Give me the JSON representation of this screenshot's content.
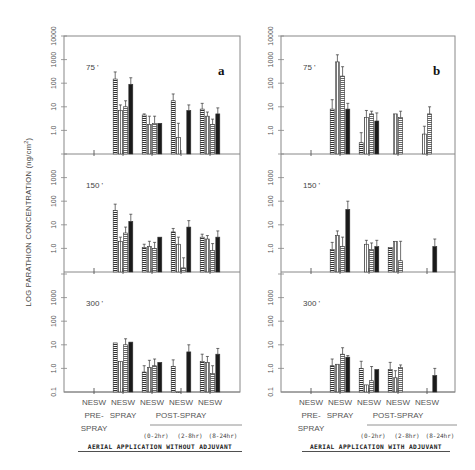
{
  "chart_data": [
    {
      "type": "bar",
      "panel": "a",
      "title": "AERIAL APPLICATION WITHOUT ADJUVANT",
      "ylabel": "LOG PARATHION CONCENTRATION (ng/cm2)",
      "yscale": "log",
      "ylim": [
        0.1,
        10000
      ],
      "yticks": [
        "0.1",
        "1.0",
        "10",
        "100",
        "1000",
        "10000"
      ],
      "series_names": [
        "N",
        "E",
        "S",
        "W"
      ],
      "categories": [
        "PRE-SPRAY",
        "SPRAY",
        "POST-SPRAY (0-2hr)",
        "POST-SPRAY (2-8hr)",
        "POST-SPRAY (8-24hr)"
      ],
      "category_top_labels": [
        "NESW",
        "NESW",
        "NESW",
        "NESW",
        "NESW"
      ],
      "rows": [
        {
          "distance": "75 '",
          "values": [
            [
              null,
              null,
              null,
              null
            ],
            [
              150,
              7,
              10,
              90
            ],
            [
              4.5,
              1.8,
              2,
              2
            ],
            [
              18,
              0.5,
              null,
              7
            ],
            [
              8,
              4,
              1.8,
              5
            ]
          ],
          "errors_upper": [
            [
              null,
              null,
              null,
              null
            ],
            [
              300,
              12,
              18,
              170
            ],
            [
              5,
              4,
              4,
              null
            ],
            [
              35,
              2,
              null,
              12
            ],
            [
              14,
              6,
              3,
              9
            ]
          ]
        },
        {
          "distance": "150 '",
          "values": [
            [
              null,
              null,
              null,
              null
            ],
            [
              40,
              2,
              4.5,
              14
            ],
            [
              1.1,
              1.2,
              1,
              3
            ],
            [
              5,
              1.5,
              0.15,
              8
            ],
            [
              3,
              2.5,
              0.8,
              3
            ]
          ],
          "errors_upper": [
            [
              null,
              null,
              null,
              null
            ],
            [
              75,
              3,
              8,
              28
            ],
            [
              1.5,
              2,
              1.8,
              null
            ],
            [
              7,
              3,
              0.4,
              15
            ],
            [
              4,
              3.5,
              1.6,
              5.5
            ]
          ]
        },
        {
          "distance": "300 '",
          "values": [
            [
              null,
              null,
              null,
              null
            ],
            [
              12,
              2,
              10,
              13
            ],
            [
              0.7,
              1.1,
              1.3,
              1.8
            ],
            [
              1.2,
              0.1,
              null,
              5
            ],
            [
              2,
              1.8,
              0.6,
              4
            ]
          ],
          "errors_upper": [
            [
              null,
              null,
              null,
              null
            ],
            [
              null,
              null,
              18,
              null
            ],
            [
              1.3,
              2.2,
              2.5,
              null
            ],
            [
              2.3,
              null,
              null,
              10
            ],
            [
              4,
              3.2,
              1.3,
              7
            ]
          ]
        }
      ]
    },
    {
      "type": "bar",
      "panel": "b",
      "title": "AERIAL APPLICATION WITH ADJUVANT",
      "ylabel": "LOG PARATHION CONCENTRATION (ng/cm2)",
      "yscale": "log",
      "ylim": [
        0.1,
        10000
      ],
      "yticks": [
        "0.1",
        "1.0",
        "10",
        "100",
        "1000",
        "10000"
      ],
      "series_names": [
        "N",
        "E",
        "S",
        "W"
      ],
      "categories": [
        "PRE-SPRAY",
        "SPRAY",
        "POST-SPRAY (0-2hr)",
        "POST-SPRAY (2-8hr)",
        "POST-SPRAY (8-24hr)"
      ],
      "category_top_labels": [
        "NESW",
        "NESW",
        "NESW",
        "NESW",
        "NESW"
      ],
      "rows": [
        {
          "distance": "75 '",
          "values": [
            [
              null,
              null,
              null,
              null
            ],
            [
              8,
              800,
              200,
              8
            ],
            [
              0.3,
              3.5,
              5,
              2.5
            ],
            [
              null,
              5,
              3.5,
              null
            ],
            [
              null,
              0.7,
              5,
              null
            ]
          ],
          "errors_upper": [
            [
              null,
              null,
              null,
              null
            ],
            [
              20,
              1600,
              500,
              14
            ],
            [
              0.8,
              7,
              6.5,
              5.5
            ],
            [
              null,
              null,
              6.5,
              null
            ],
            [
              null,
              1.5,
              10,
              null
            ]
          ]
        },
        {
          "distance": "150 '",
          "values": [
            [
              null,
              null,
              null,
              null
            ],
            [
              0.9,
              3.5,
              1.2,
              45
            ],
            [
              null,
              1.5,
              0.9,
              1.2
            ],
            [
              1.1,
              2,
              0.3,
              null
            ],
            [
              null,
              null,
              null,
              1.2
            ]
          ],
          "errors_upper": [
            [
              null,
              null,
              null,
              null
            ],
            [
              1.8,
              5.5,
              3,
              100
            ],
            [
              null,
              2.2,
              1.7,
              2.2
            ],
            [
              null,
              2,
              2,
              0.7
            ],
            [
              null,
              null,
              null,
              2.5
            ]
          ]
        },
        {
          "distance": "300 '",
          "values": [
            [
              null,
              null,
              null,
              null
            ],
            [
              1.3,
              1.5,
              4,
              3
            ],
            [
              1,
              0.2,
              0.3,
              0.9
            ],
            [
              0.9,
              0.4,
              1.1,
              null
            ],
            [
              null,
              null,
              null,
              0.5
            ]
          ],
          "errors_upper": [
            [
              null,
              null,
              null,
              null
            ],
            [
              2.5,
              null,
              7.5,
              3.5
            ],
            [
              2,
              null,
              1.2,
              null
            ],
            [
              1.8,
              0.8,
              1.4,
              null
            ],
            [
              null,
              null,
              null,
              1
            ]
          ]
        }
      ]
    }
  ],
  "labels": {
    "ylabel": "LOG  PARATHION CONCENTRATION  (ng/cm²)",
    "yticks": [
      "0.1",
      "1.0",
      "10",
      "100",
      "1000",
      "10000"
    ],
    "top_panel_tick_labels": [
      "1.0",
      "10",
      "100",
      "1000",
      "10000"
    ],
    "panel_letters": [
      "a",
      "b"
    ],
    "distances": [
      "75 '",
      "150 '",
      "300 '"
    ],
    "category_nesw": "NESW",
    "pre_line1": "PRE-",
    "pre_line2": "SPRAY",
    "spray": "SPRAY",
    "post_spray": "POST-SPRAY",
    "sub_intervals": [
      "(0-2hr)",
      "(2-8hr)",
      "(8-24hr)"
    ],
    "title_a": "AERIAL APPLICATION WITHOUT ADJUVANT",
    "title_b": "AERIAL APPLICATION WITH ADJUVANT"
  },
  "colors": {
    "axis": "#888888",
    "bar_outline": "#333333",
    "bar_solid": "#1a1a1a",
    "text": "#444444"
  }
}
